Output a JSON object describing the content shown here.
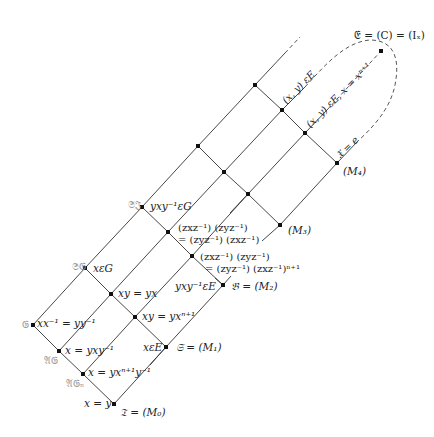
{
  "diagram": {
    "type": "lattice",
    "nodes": [
      {
        "id": "G",
        "x": 33,
        "y": 325,
        "name": "𝔊",
        "label": "xx⁻¹ = yy⁻¹"
      },
      {
        "id": "AG",
        "x": 59,
        "y": 351,
        "name": "𝔄𝔊",
        "label": "x = yxy⁻¹"
      },
      {
        "id": "AGn",
        "x": 83,
        "y": 374,
        "name": "𝔄𝔊ₙ",
        "label": "x = yxⁿ⁺¹y⁻¹"
      },
      {
        "id": "T",
        "x": 114,
        "y": 404,
        "name": "𝔗 = (M₀)",
        "label": "x = y"
      },
      {
        "id": "SG",
        "x": 85,
        "y": 268,
        "name": "𝔖𝔊",
        "label": "xεG"
      },
      {
        "id": "n1",
        "x": 111,
        "y": 294,
        "label": "xy = yx"
      },
      {
        "id": "n2",
        "x": 135,
        "y": 317,
        "label": "xy = yxⁿ⁺¹"
      },
      {
        "id": "M1",
        "x": 166,
        "y": 347,
        "name": "𝔖 = (M₁)",
        "label": "xεE"
      },
      {
        "id": "SI",
        "x": 142,
        "y": 207,
        "name": "𝔖𝔍",
        "label": "yxy⁻¹εG"
      },
      {
        "id": "n3",
        "x": 168,
        "y": 232,
        "label": "(zxz⁻¹)(zyz⁻¹) = (zyz⁻¹)(zxz⁻¹)"
      },
      {
        "id": "n4",
        "x": 192,
        "y": 256,
        "label": "(zxz⁻¹)(zyz⁻¹) = (zyz⁻¹)(zxz⁻¹)ⁿ⁺¹"
      },
      {
        "id": "M2",
        "x": 223,
        "y": 285,
        "name": "𝔅 = (M₂)",
        "label": "yxy⁻¹εE"
      },
      {
        "id": "n5",
        "x": 198,
        "y": 146
      },
      {
        "id": "n6",
        "x": 224,
        "y": 172
      },
      {
        "id": "n7",
        "x": 248,
        "y": 194
      },
      {
        "id": "M3",
        "x": 280,
        "y": 225,
        "name": "(M₃)"
      },
      {
        "id": "n8",
        "x": 255,
        "y": 85
      },
      {
        "id": "n9",
        "x": 282,
        "y": 110,
        "label": "(x, y) εE"
      },
      {
        "id": "n10",
        "x": 305,
        "y": 133,
        "label": "(x, y) εE, x = xⁿ⁺¹"
      },
      {
        "id": "M4",
        "x": 337,
        "y": 163,
        "name": "(M₄)",
        "label": "𝔛 = e"
      },
      {
        "id": "C",
        "x": 381,
        "y": 51,
        "name": "𝔈 = (C) = (Iₓ)"
      }
    ]
  },
  "labels": {
    "G_name": "𝔊",
    "G_eq": "xx⁻¹ = yy⁻¹",
    "AG_name": "𝔄𝔊",
    "AG_eq": "x = yxy⁻¹",
    "AGn_name": "𝔄𝔊ₙ",
    "AGn_eq": "x = yxⁿ⁺¹y⁻¹",
    "T_eq": "x = y",
    "T_name": "𝔗 = (M₀)",
    "SG_name": "𝔖𝔊",
    "SG_eq": "xεG",
    "n1_eq": "xy = yx",
    "n2_eq": "xy = yxⁿ⁺¹",
    "M1_eq": "xεE",
    "M1_name": "𝔖 = (M₁)",
    "SI_name": "𝔖𝔍",
    "SI_eq": "yxy⁻¹εG",
    "n3_eq_1": "(zxz⁻¹) (zyz⁻¹)",
    "n3_eq_2": "= (zyz⁻¹) (zxz⁻¹)",
    "n4_eq_1": "(zxz⁻¹) (zyz⁻¹)",
    "n4_eq_2": "= (zyz⁻¹) (zxz⁻¹)ⁿ⁺¹",
    "M2_eq": "yxy⁻¹εE",
    "M2_name": "𝔅 = (M₂)",
    "M3_name": "(M₃)",
    "M4_name": "(M₄)",
    "n9_eq": "(x, y) εE",
    "n10_eq": "(x, y) εE, x = xⁿ⁺¹",
    "M4_eq": "𝔛 = e",
    "C_name": "𝔈 = (C) = (Iₓ)"
  }
}
